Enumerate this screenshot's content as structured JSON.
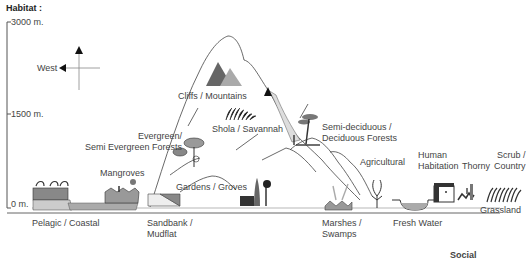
{
  "title": "Habitat :",
  "axis": {
    "ticks": [
      "3000 m.",
      "1500 m.",
      "0 m."
    ]
  },
  "compass": {
    "label": "West"
  },
  "habitats": [
    {
      "id": "pelagic",
      "lines": [
        "Pelagic / Coastal"
      ]
    },
    {
      "id": "mangroves",
      "lines": [
        "Mangroves"
      ]
    },
    {
      "id": "sandbank",
      "lines": [
        "Sandbank /",
        "Mudflat"
      ]
    },
    {
      "id": "evergreen",
      "lines": [
        "Evergreen/",
        "Semi Evergreen Forests"
      ]
    },
    {
      "id": "cliffs",
      "lines": [
        "Cliffs / Mountains"
      ]
    },
    {
      "id": "shola",
      "lines": [
        "Shola / Savannah"
      ]
    },
    {
      "id": "gardens",
      "lines": [
        "Gardens / Groves"
      ]
    },
    {
      "id": "semideciduous",
      "lines": [
        "Semi-deciduous /",
        "Deciduous Forests"
      ]
    },
    {
      "id": "marshes",
      "lines": [
        "Marshes /",
        "Swamps"
      ]
    },
    {
      "id": "agricultural",
      "lines": [
        "Agricultural"
      ]
    },
    {
      "id": "freshwater",
      "lines": [
        "Fresh Water"
      ]
    },
    {
      "id": "human",
      "lines": [
        "Human",
        "Habitation"
      ]
    },
    {
      "id": "thorny",
      "lines": [
        "Thorny"
      ]
    },
    {
      "id": "scrub",
      "lines": [
        "Scrub /",
        "Country"
      ]
    },
    {
      "id": "grassland",
      "lines": [
        "Grassland"
      ]
    }
  ],
  "footer_fragment": "Social"
}
